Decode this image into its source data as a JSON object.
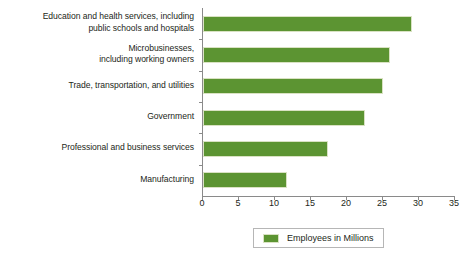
{
  "chart_data": {
    "type": "bar",
    "orientation": "horizontal",
    "title": "",
    "xlabel": "",
    "ylabel": "",
    "xlim": [
      0,
      35
    ],
    "xticks": [
      0,
      5,
      10,
      15,
      20,
      25,
      30,
      35
    ],
    "grid": false,
    "legend_position": "bottom",
    "bar_color": "#5c9432",
    "categories": [
      "Education and health services, including\npublic schools and hospitals",
      "Microbusinesses,\nincluding working owners",
      "Trade, transportation, and utilities",
      "Government",
      "Professional and business services",
      "Manufacturing"
    ],
    "series": [
      {
        "name": "Employees in Millions",
        "values": [
          29,
          26,
          25,
          22.5,
          17.3,
          11.7
        ]
      }
    ]
  },
  "legend": {
    "entries": [
      {
        "label": "Employees in Millions",
        "color": "#5c9432"
      }
    ]
  }
}
